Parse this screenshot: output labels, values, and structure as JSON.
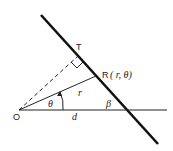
{
  "diagram": {
    "type": "geometry",
    "labels": {
      "T": "T",
      "R": "R",
      "R_coords": "( r, θ)",
      "O": "O",
      "d": "d",
      "theta": "θ",
      "r": "r",
      "beta": "β"
    },
    "elements": [
      {
        "name": "line",
        "description": "thick straight line crossing horizontal axis"
      },
      {
        "name": "horizontal-axis",
        "description": "horizontal line from O"
      },
      {
        "name": "perpendicular",
        "description": "dashed line from O to T, perpendicular to thick line"
      },
      {
        "name": "radius",
        "description": "solid line from O to R of length r"
      },
      {
        "name": "right-angle-marker",
        "description": "square at T"
      },
      {
        "name": "theta-arc",
        "description": "arc with arrow indicating angle theta"
      }
    ],
    "colors": {
      "stroke": "#111111",
      "background": "#ffffff"
    }
  }
}
